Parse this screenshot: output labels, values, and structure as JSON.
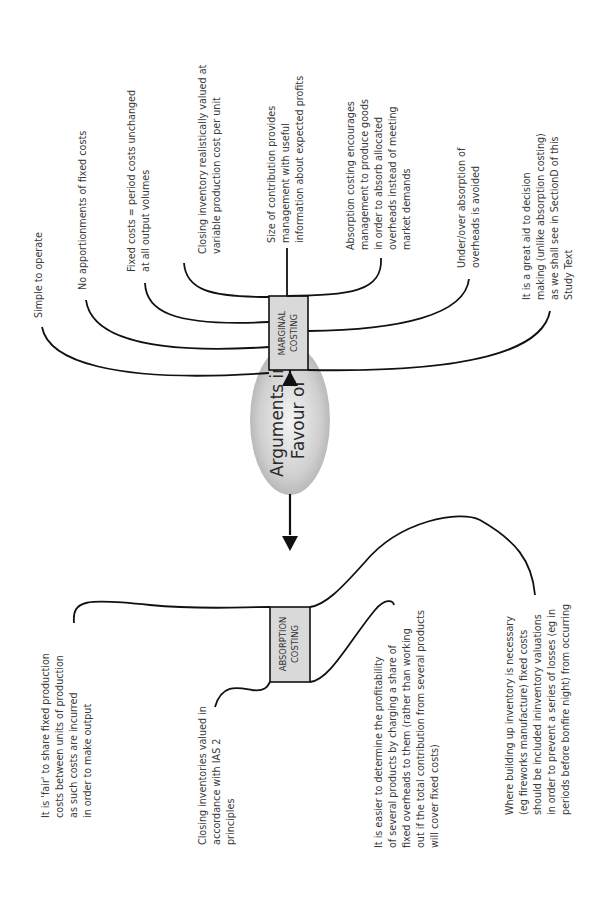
{
  "diagram": {
    "orientation": "rotated 90 degrees counterclockwise",
    "center": {
      "line1": "Arguments in",
      "line2": "Favour of"
    },
    "marginal": {
      "title_line1": "MARGINAL",
      "title_line2": "COSTING",
      "arguments": [
        {
          "lines": [
            "Simple to operate"
          ]
        },
        {
          "lines": [
            "No apportionments of fixed costs"
          ]
        },
        {
          "lines": [
            "Fixed costs = period costs unchanged",
            "at all output volumes"
          ]
        },
        {
          "lines": [
            "Closing inventory realistically valued at",
            "variable production cost per unit"
          ]
        },
        {
          "lines": [
            "Size of contribution provides",
            "management with useful",
            "information about expected profits"
          ]
        },
        {
          "lines": [
            "Absorption costing encourages",
            "management to produce goods",
            "in order to absorb allocated",
            "overheads instead of meeting",
            "market demands"
          ]
        },
        {
          "lines": [
            "Under/over absorption of",
            "overheads is avoided"
          ]
        },
        {
          "lines": [
            "It is a great aid to decision",
            "making (unlike absorption costing)",
            "as we shall see in SectionD of this",
            "Study Text"
          ]
        }
      ]
    },
    "absorption": {
      "title_line1": "ABSORPTION",
      "title_line2": "COSTING",
      "arguments": [
        {
          "lines": [
            "It is 'fair' to share fixed production",
            "costs between units of production",
            "as such costs are incurred",
            "in order to make output"
          ]
        },
        {
          "lines": [
            "Closing inventories valued in",
            "accordance with IAS 2",
            "principles"
          ]
        },
        {
          "lines": [
            "It is easier to determine the profitability",
            "of several products by charging a share of",
            "fixed overheads to them (rather than working",
            "out if the total contribution from several products",
            "will cover fixed costs)"
          ]
        },
        {
          "lines": [
            "Where building up inventory is necessary",
            "(eg fireworks manufacture) fixed costs",
            "should be included ininventory valuations",
            "in order to prevent a series of losses (eg in",
            "periods before bonfire night) from occurring"
          ]
        }
      ]
    }
  },
  "colors": {
    "box_fill": "#d9d9d9",
    "oval_center": "#f2f2f2",
    "oval_edge": "#b5b5b5",
    "line": "#111111",
    "text": "#3a3a3a"
  }
}
